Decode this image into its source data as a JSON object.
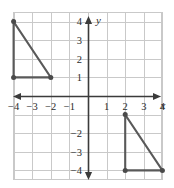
{
  "figure": {
    "background_color": "#ffffff",
    "grid_color": "#c9c9c9",
    "axis_color": "#3b3b3b",
    "shape_color": "#595959",
    "vertex_color": "#4a4a4a"
  },
  "chart_data": {
    "type": "scatter",
    "title": "",
    "xlabel": "x",
    "ylabel": "y",
    "xlim": [
      -5,
      4.9
    ],
    "ylim": [
      -4.9,
      4.9
    ],
    "grid": true,
    "legend": null,
    "x_tick_labels": [
      "-4",
      "-3",
      "-2",
      "-1",
      "1",
      "2",
      "3",
      "4"
    ],
    "x_tick_values": [
      -4,
      -3,
      -2,
      -1,
      1,
      2,
      3,
      4
    ],
    "y_tick_labels": [
      "4",
      "3",
      "2",
      "1",
      "-2",
      "-3",
      "-4"
    ],
    "y_tick_values": [
      4,
      3,
      2,
      1,
      -2,
      -3,
      -4
    ],
    "series": [
      {
        "name": "triangle-upper-left",
        "closed": true,
        "points": [
          [
            -4,
            4
          ],
          [
            -4,
            1
          ],
          [
            -2,
            1
          ]
        ]
      },
      {
        "name": "triangle-lower-right",
        "closed": true,
        "points": [
          [
            2,
            -1
          ],
          [
            2,
            -4
          ],
          [
            4,
            -4
          ]
        ]
      }
    ]
  },
  "axes": {
    "x_axis_label": "x",
    "y_axis_label": "y"
  }
}
